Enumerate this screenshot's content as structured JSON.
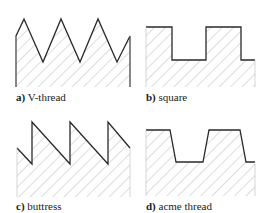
{
  "panels": [
    {
      "id": "a",
      "letter": "a)",
      "label": "V-thread"
    },
    {
      "id": "b",
      "letter": "b)",
      "label": "square"
    },
    {
      "id": "c",
      "letter": "c)",
      "label": "buttress"
    },
    {
      "id": "d",
      "letter": "d)",
      "label": "acme thread"
    }
  ],
  "colors": {
    "outline": "#2a2a2a",
    "hatch": "#9a9a9a",
    "background": "#ffffff"
  }
}
